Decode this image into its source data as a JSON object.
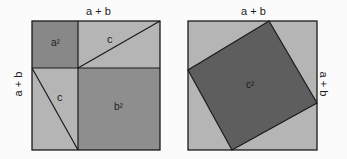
{
  "left_figure": {
    "top_label": "a + b",
    "side_label": "a + b",
    "a_square_label": "a²",
    "b_square_label": "b²",
    "triangle_top_label": "c",
    "triangle_left_label": "c"
  },
  "right_figure": {
    "top_label": "a + b",
    "side_label": "a + b",
    "c_square_label": "c²"
  },
  "colors": {
    "background": "#fbfbfb",
    "light_fill": "#b5b5b5",
    "medium_fill": "#8c8c8c",
    "dark_fill": "#5e5e5e",
    "stroke": "#1a1a1a"
  }
}
